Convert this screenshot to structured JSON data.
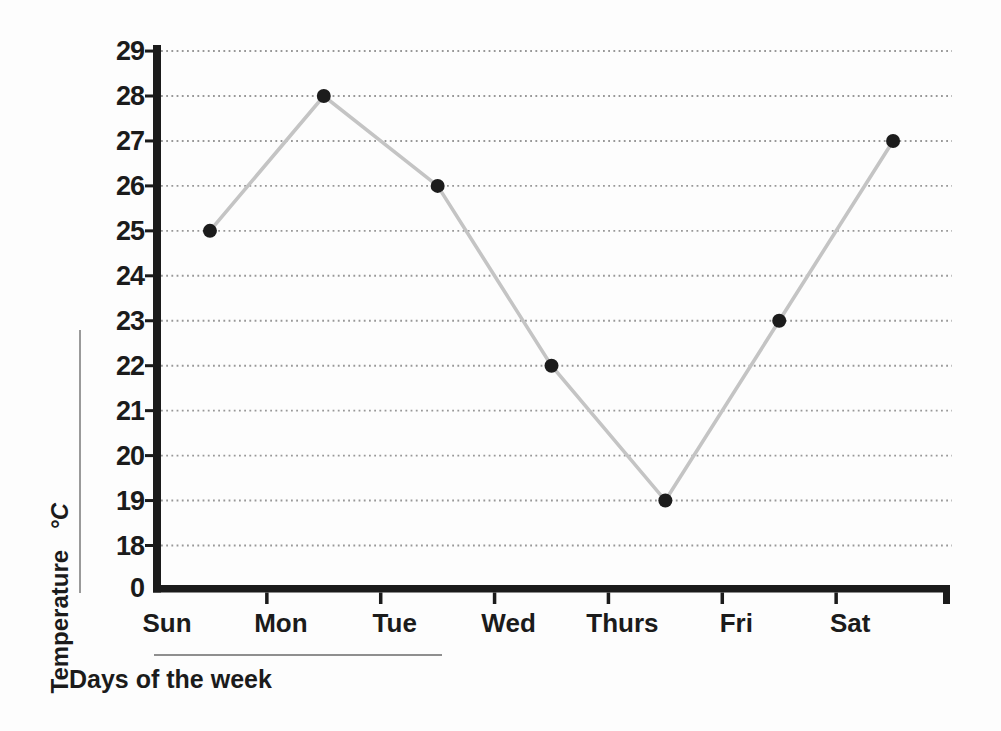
{
  "figure": {
    "ylabel": "Temperature",
    "ylabel_unit": "°C",
    "xlabel": "Days of the week"
  },
  "chart_data": {
    "type": "line",
    "title": "",
    "xlabel": "Days of the week",
    "ylabel": "Temperature °C",
    "categories": [
      "Sun",
      "Mon",
      "Tue",
      "Wed",
      "Thurs",
      "Fri",
      "Sat"
    ],
    "series": [
      {
        "name": "Daily temperature",
        "values": [
          25,
          28,
          26,
          22,
          19,
          23,
          27
        ]
      }
    ],
    "y_ticks": [
      0,
      18,
      19,
      20,
      21,
      22,
      23,
      24,
      25,
      26,
      27,
      28,
      29
    ],
    "y_axis_break_between": [
      0,
      18
    ],
    "ylim": [
      0,
      29
    ],
    "grid": "horizontal-dotted",
    "legend": "none",
    "colors": {
      "line": "#c4c4c4",
      "marker": "#1c1c1c",
      "axis": "#1b1b1b",
      "grid_dots": "#989898",
      "text": "#1b1b1b",
      "rule": "#8f8f8f"
    }
  }
}
